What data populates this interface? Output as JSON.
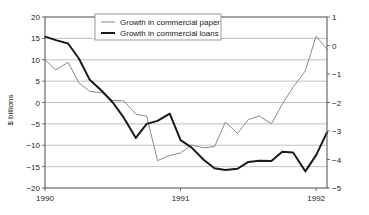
{
  "chart_data": {
    "type": "line",
    "title": "",
    "xlabel": "",
    "ylabel": "$ billions",
    "y2label": "",
    "grid": true,
    "legend_position": "top-center",
    "xlim": [
      1990.0,
      1992.08
    ],
    "ylim": [
      -20,
      20
    ],
    "y2lim": [
      -5,
      1
    ],
    "xticks": [
      1990,
      1991,
      1992
    ],
    "xticklabels": [
      "1990",
      "1991",
      "1992"
    ],
    "yticks": [
      20,
      15,
      10,
      5,
      0,
      -5,
      -10,
      -15,
      -20
    ],
    "yticklabels": [
      "20",
      "15",
      "10",
      "5",
      "0",
      "−5",
      "−10",
      "−15",
      "−20"
    ],
    "y2ticks": [
      1,
      0,
      -1,
      -2,
      -3,
      -4,
      -5
    ],
    "y2ticklabels": [
      "1",
      "0",
      "−1",
      "−2",
      "−3",
      "−4",
      "−5"
    ],
    "series": [
      {
        "name": "Growth in commercial paper",
        "axis": "right",
        "color": "#8a8a8a",
        "width": 1,
        "x": [
          1990.0,
          1990.08,
          1990.17,
          1990.25,
          1990.33,
          1990.42,
          1990.5,
          1990.58,
          1990.67,
          1990.75,
          1990.83,
          1990.92,
          1991.0,
          1991.08,
          1991.17,
          1991.25,
          1991.33,
          1991.42,
          1991.5,
          1991.58,
          1991.67,
          1991.75,
          1991.83,
          1991.92,
          1992.0,
          1992.08
        ],
        "values_left_scale": [
          10.0,
          7.6,
          9.4,
          4.6,
          2.6,
          2.3,
          0.5,
          0.4,
          -2.7,
          -3.2,
          -13.6,
          -12.4,
          -11.8,
          -9.9,
          -10.6,
          -10.3,
          -4.6,
          -7.2,
          -4.0,
          -3.1,
          -5.0,
          -0.4,
          3.6,
          7.4,
          15.5,
          12.5
        ],
        "values": [
          -0.5,
          -0.86,
          -0.59,
          -1.31,
          -1.61,
          -1.66,
          -1.93,
          -1.94,
          -2.41,
          -2.48,
          -4.04,
          -3.86,
          -3.77,
          -3.49,
          -3.59,
          -3.55,
          -2.69,
          -3.08,
          -2.6,
          -2.47,
          -2.75,
          -2.06,
          -1.46,
          -0.89,
          0.33,
          -0.13
        ]
      },
      {
        "name": "Growth in commercial loans",
        "axis": "left",
        "color": "#1a1a1a",
        "width": 2,
        "x": [
          1990.0,
          1990.08,
          1990.17,
          1990.25,
          1990.33,
          1990.42,
          1990.5,
          1990.58,
          1990.67,
          1990.75,
          1990.83,
          1990.92,
          1991.0,
          1991.08,
          1991.17,
          1991.25,
          1991.33,
          1991.42,
          1991.5,
          1991.58,
          1991.67,
          1991.75,
          1991.83,
          1991.92,
          1992.0,
          1992.08
        ],
        "values": [
          15.4,
          14.6,
          13.8,
          10.3,
          5.3,
          2.7,
          0.0,
          -3.5,
          -8.3,
          -5.0,
          -4.3,
          -2.6,
          -8.8,
          -10.5,
          -13.4,
          -15.4,
          -15.8,
          -15.5,
          -13.9,
          -13.6,
          -13.7,
          -11.5,
          -11.7,
          -16.1,
          -12.3,
          -7.0
        ]
      }
    ]
  },
  "axes": {
    "ylabel": "$ billions"
  },
  "legend": {
    "items": [
      {
        "label": "Growth in commercial paper"
      },
      {
        "label": "Growth in commercial loans"
      }
    ]
  }
}
